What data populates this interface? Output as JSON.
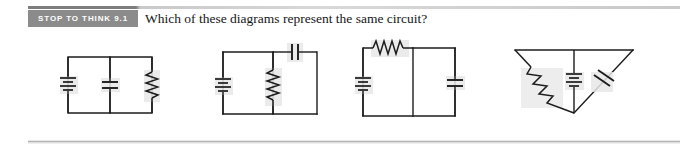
{
  "header": {
    "badge_label": "STOP TO THINK 9.1",
    "badge_color": "#8b8b8b",
    "badge_text_color": "#ffffff",
    "question": "Which of these diagrams represent the same circuit?"
  },
  "rules": {
    "top_accent_color": "#7d7d7d",
    "top_fade_color": "#cfcfcf",
    "bottom_color": "#b4b4b4"
  },
  "circuit_style": {
    "wire_color": "#1c1c1c",
    "wire_width": 1.4,
    "highlight_color": "#e6e6e6"
  },
  "options": [
    {
      "id": "A",
      "label": "A.",
      "description": "Battery, capacitor and resistor all in parallel across a rectangular loop",
      "components": [
        {
          "type": "battery",
          "position": "left-branch-vertical"
        },
        {
          "type": "capacitor",
          "position": "middle-branch-vertical"
        },
        {
          "type": "resistor",
          "position": "right-branch-vertical"
        }
      ]
    },
    {
      "id": "B",
      "label": "B.",
      "description": "Battery on left branch, resistor on middle branch, capacitor in the top-right wire",
      "components": [
        {
          "type": "battery",
          "position": "left-branch-vertical"
        },
        {
          "type": "resistor",
          "position": "middle-branch-vertical"
        },
        {
          "type": "capacitor",
          "position": "top-right-horizontal"
        }
      ]
    },
    {
      "id": "C",
      "label": "C.",
      "description": "Battery on left branch, resistor in the top-left wire, capacitor on right branch",
      "components": [
        {
          "type": "battery",
          "position": "left-branch-vertical"
        },
        {
          "type": "resistor",
          "position": "top-left-horizontal"
        },
        {
          "type": "capacitor",
          "position": "right-branch-vertical"
        }
      ]
    },
    {
      "id": "D",
      "label": "D.",
      "description": "Inverted triangle layout: resistor on the left diagonal, battery on the centre vertical, capacitor on the right diagonal",
      "components": [
        {
          "type": "resistor",
          "position": "left-diagonal"
        },
        {
          "type": "battery",
          "position": "center-vertical"
        },
        {
          "type": "capacitor",
          "position": "right-diagonal"
        }
      ]
    }
  ]
}
